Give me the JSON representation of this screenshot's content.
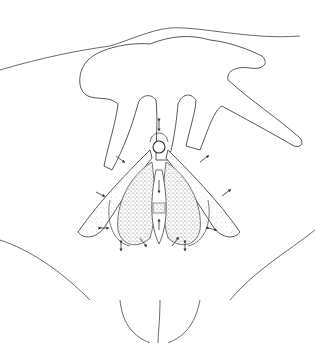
{
  "illustration": {
    "subject": "anatomical line drawing",
    "style": "black ink outline with stippled shading",
    "background": "#ffffff",
    "stroke": "#333333",
    "stipple": "#6b6b6b",
    "arrows_count": 13
  }
}
